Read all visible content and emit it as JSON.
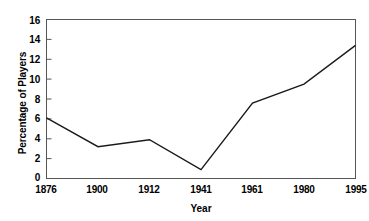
{
  "chart_data": {
    "type": "line",
    "title": "",
    "xlabel": "Year",
    "ylabel": "Percentage of Players",
    "categories": [
      "1876",
      "1900",
      "1912",
      "1941",
      "1961",
      "1980",
      "1995"
    ],
    "values": [
      6.1,
      3.2,
      3.9,
      0.9,
      7.6,
      9.5,
      13.4
    ],
    "series": [
      {
        "name": "Percentage of Players",
        "values": [
          6.1,
          3.2,
          3.9,
          0.9,
          7.6,
          9.5,
          13.4
        ]
      }
    ],
    "ylim": [
      0,
      16
    ],
    "yticks": [
      "0",
      "2",
      "4",
      "6",
      "8",
      "10",
      "12",
      "14",
      "16"
    ],
    "ytick_values": [
      0,
      2,
      4,
      6,
      8,
      10,
      12,
      14,
      16
    ],
    "xtick_labels": [
      "1876",
      "1900",
      "1912",
      "1941",
      "1961",
      "1980",
      "1995"
    ],
    "grid": false,
    "legend": false,
    "legend_position": "none",
    "line_color": "#1a1a1a",
    "axis_color": "#555555",
    "background_color": "#ffffff",
    "frame": true,
    "markers": false
  }
}
